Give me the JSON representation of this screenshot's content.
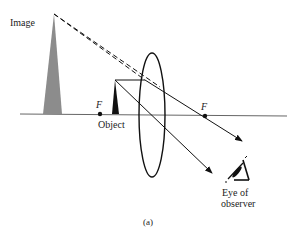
{
  "figure": {
    "caption": "(a)",
    "type": "Simple magnifier ray diagram (converging lens, virtual image)"
  },
  "labels": {
    "image": "Image",
    "object": "Object",
    "focal_left": "F",
    "focal_right": "F",
    "eye_line1": "Eye of",
    "eye_line2": "observer"
  },
  "colors": {
    "line": "#111111",
    "axis": "#555555",
    "image_fill": "#8c8c8c",
    "object_fill": "#111111",
    "background": "#ffffff"
  },
  "geometry": {
    "axis": {
      "x1": 20,
      "y1": 114,
      "x2": 287,
      "y2": 116
    },
    "lens": {
      "cx": 152,
      "cy": 115,
      "rx": 13,
      "ry": 62
    },
    "focal_left": {
      "x": 100,
      "y": 114
    },
    "focal_right": {
      "x": 205,
      "y": 116
    },
    "object": {
      "apex": [
        115,
        80
      ],
      "base_left": 112,
      "base_right": 119,
      "base_y": 114
    },
    "image": {
      "apex": [
        54,
        14
      ],
      "base_left": 43,
      "base_right": 62,
      "base_y": 114
    }
  }
}
